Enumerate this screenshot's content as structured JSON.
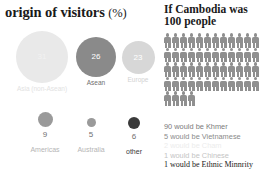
{
  "left_panel": {
    "title": "origin of visitors",
    "title_suffix": "(%)",
    "chart_data": {
      "type": "bubble",
      "title": "origin of visitors (%)",
      "xlabel": "",
      "ylabel": "",
      "unit": "%",
      "categories": [
        "Asia (non-Asean)",
        "Asean",
        "Europe",
        "Americas",
        "Australia",
        "other"
      ],
      "values": [
        31,
        26,
        23,
        9,
        5,
        6
      ],
      "colors": [
        "#e9e9e9",
        "#8a8a8a",
        "#d7d7d7",
        "#9a9a9a",
        "#9a9a9a",
        "#3a3a3a"
      ],
      "legend": "none",
      "grid": false
    },
    "bubbles_large": [
      {
        "label": "Asia (non-Asean)",
        "value": "31",
        "color": "#e9e9e9",
        "label_color": "#e2e2e2",
        "value_color": "#f2f2f2",
        "size": 52
      },
      {
        "label": "Asean",
        "value": "26",
        "color": "#8a8a8a",
        "label_color": "#6f6f6f",
        "value_color": "#ffffff",
        "size": 40
      },
      {
        "label": "Europe",
        "value": "23",
        "color": "#d7d7d7",
        "label_color": "#d2d2d2",
        "value_color": "#ffffff",
        "size": 33
      }
    ],
    "bubbles_small": [
      {
        "label": "Americas",
        "value": "9",
        "color": "#9a9a9a",
        "label_color": "#b5b5b5",
        "size": 15
      },
      {
        "label": "Australia",
        "value": "5",
        "color": "#9a9a9a",
        "label_color": "#b5b5b5",
        "size": 9
      },
      {
        "label": "other",
        "value": "6",
        "color": "#3a3a3a",
        "label_color": "#3a3a3a",
        "size": 12
      }
    ]
  },
  "right_panel": {
    "title_line1": "If Cambodia was",
    "title_line2": "100 people",
    "pictogram": {
      "type": "pictogram",
      "icon": "person-icon",
      "total": 100,
      "columns": 12,
      "rows": 5,
      "icon_color": "#8f8f8f"
    },
    "legend": [
      {
        "text": "90 would be Khmer",
        "color": "#7a7a7a",
        "bold": false
      },
      {
        "text": "5 would be Vietnamese",
        "color": "#8a8a8a",
        "bold": false
      },
      {
        "text": "2 would be Cham",
        "color": "#ececec",
        "bold": false
      },
      {
        "text": "1 would be Chinese",
        "color": "#c4c4c4",
        "bold": false
      },
      {
        "text": "1 would be Ethnic Minnrity",
        "color": "#1a1a1a",
        "bold": true
      }
    ]
  }
}
